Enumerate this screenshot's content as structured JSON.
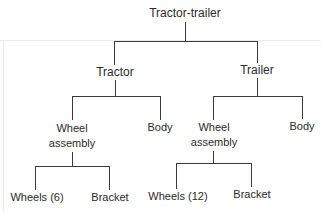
{
  "diagram": {
    "type": "tree",
    "root": {
      "label": "Tractor-trailer"
    },
    "level1": [
      {
        "label": "Tractor"
      },
      {
        "label": "Trailer"
      }
    ],
    "tractor_children": [
      {
        "label_line1": "Wheel",
        "label_line2": "assembly"
      },
      {
        "label": "Body"
      }
    ],
    "trailer_children": [
      {
        "label_line1": "Wheel",
        "label_line2": "assembly"
      },
      {
        "label": "Body"
      }
    ],
    "tractor_wheel_parts": [
      {
        "label": "Wheels (6)"
      },
      {
        "label": "Bracket"
      }
    ],
    "trailer_wheel_parts": [
      {
        "label": "Wheels (12)"
      },
      {
        "label": "Bracket"
      }
    ]
  }
}
